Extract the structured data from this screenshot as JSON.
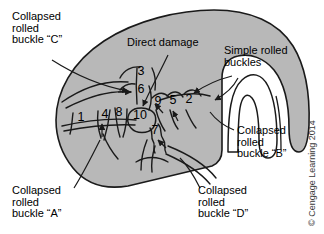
{
  "figure": {
    "panel_fill": "#b8b8b8",
    "panel_stroke": "#1a1a1a",
    "background": "#ffffff",
    "credit": "© Cengage Learning 2014"
  },
  "callouts": [
    {
      "id": "collapsed-rolled-buckle-c",
      "lines": [
        "Collapsed",
        "rolled",
        "buckle “C”"
      ],
      "x": 12,
      "y": 20
    },
    {
      "id": "direct-damage",
      "lines": [
        "Direct damage"
      ],
      "x": 127,
      "y": 46
    },
    {
      "id": "simple-rolled-buckles",
      "lines": [
        "Simple rolled",
        "buckles"
      ],
      "x": 224,
      "y": 54
    },
    {
      "id": "collapsed-rolled-buckle-b",
      "lines": [
        "Collapsed",
        "rolled",
        "buckle “B”"
      ],
      "x": 237,
      "y": 134
    },
    {
      "id": "collapsed-rolled-buckle-a",
      "lines": [
        "Collapsed",
        "rolled",
        "buckle “A”"
      ],
      "x": 12,
      "y": 194
    },
    {
      "id": "collapsed-rolled-buckle-d",
      "lines": [
        "Collapsed",
        "rolled",
        "buckle “D”"
      ],
      "x": 198,
      "y": 194
    }
  ],
  "numbers": [
    {
      "label": "1",
      "x": 81,
      "y": 121
    },
    {
      "label": "2",
      "x": 189,
      "y": 103
    },
    {
      "label": "3",
      "x": 141,
      "y": 75
    },
    {
      "label": "4",
      "x": 105,
      "y": 118
    },
    {
      "label": "5",
      "x": 173,
      "y": 104
    },
    {
      "label": "6",
      "x": 141,
      "y": 93
    },
    {
      "label": "7",
      "x": 155,
      "y": 134
    },
    {
      "label": "8",
      "x": 119,
      "y": 116
    },
    {
      "label": "9",
      "x": 158,
      "y": 105
    },
    {
      "label": "10",
      "x": 140,
      "y": 119
    }
  ]
}
